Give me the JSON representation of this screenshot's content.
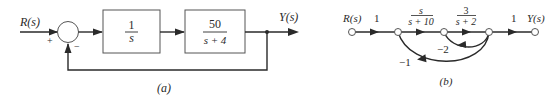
{
  "diagram_a": {
    "caption": "(a)",
    "input_label": "R(s)",
    "output_label": "Y(s)",
    "summing_junction": {
      "plus_sign": "+",
      "minus_sign": "−"
    },
    "blocks": [
      {
        "numerator": "1",
        "denominator": "s"
      },
      {
        "numerator": "50",
        "denominator": "s + 4"
      }
    ],
    "feedback": "unity negative feedback"
  },
  "diagram_b": {
    "caption": "(b)",
    "input_label": "R(s)",
    "output_label": "Y(s)",
    "branches": [
      {
        "gain": "1"
      },
      {
        "numerator": "s",
        "denominator": "s + 10"
      },
      {
        "numerator": "3",
        "denominator": "s + 2"
      },
      {
        "gain": "1"
      }
    ],
    "feedback_loops": [
      {
        "gain": "−2"
      },
      {
        "gain": "−1"
      }
    ]
  }
}
